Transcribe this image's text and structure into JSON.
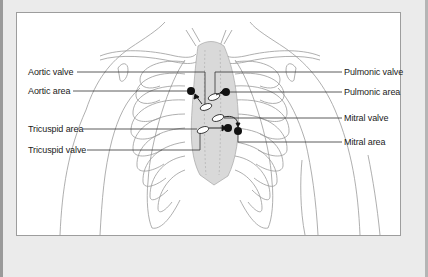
{
  "diagram": {
    "labels_left": [
      {
        "id": "aortic-valve",
        "text": "Aortic valve"
      },
      {
        "id": "aortic-area",
        "text": "Aortic area"
      },
      {
        "id": "tricuspid-area",
        "text": "Tricuspid area"
      },
      {
        "id": "tricuspid-valve",
        "text": "Tricuspid valve"
      }
    ],
    "labels_right": [
      {
        "id": "pulmonic-valve",
        "text": "Pulmonic valve"
      },
      {
        "id": "pulmonic-area",
        "text": "Pulmonic area"
      },
      {
        "id": "mitral-valve",
        "text": "Mitral valve"
      },
      {
        "id": "mitral-area",
        "text": "Mitral area"
      }
    ],
    "colors": {
      "background": "#ebebeb",
      "panel": "#ffffff",
      "outline": "#8a8a8a",
      "heart_fill": "#d9d9d9",
      "leader_line": "#333333",
      "marker": "#111111"
    }
  }
}
